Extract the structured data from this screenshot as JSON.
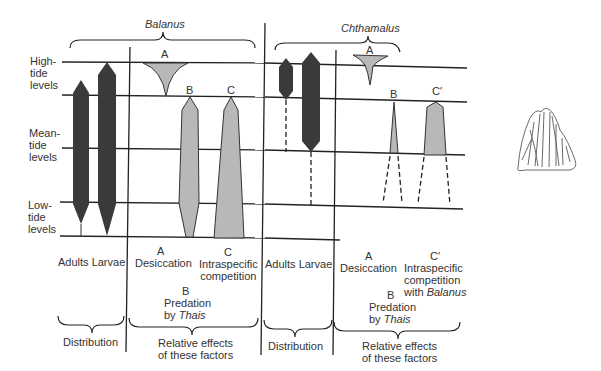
{
  "species": {
    "balanus": "Balanus",
    "chthamalus": "Chthamalus"
  },
  "tide_labels": {
    "high": [
      "High-",
      "tide",
      "levels"
    ],
    "mean": [
      "Mean-",
      "tide",
      "levels"
    ],
    "low": [
      "Low-",
      "tide",
      "levels"
    ]
  },
  "balanus_panel": {
    "distribution_cols": "Adults Larvae",
    "distribution_label": "Distribution",
    "factor_a_letter": "A",
    "factor_a": "Desiccation",
    "factor_b_letter": "B",
    "factor_b_line1": "Predation",
    "factor_b_by": "by ",
    "factor_b_genus": "Thais",
    "factor_c_letter": "C",
    "factor_c_line1": "Intraspecific",
    "factor_c_line2": "competition",
    "effects_line1": "Relative effects",
    "effects_line2": "of these factors"
  },
  "chthamalus_panel": {
    "distribution_cols": "Adults Larvae",
    "distribution_label": "Distribution",
    "factor_a_letter": "A",
    "factor_a": "Desiccation",
    "factor_b_letter": "B",
    "factor_b_line1": "Predation",
    "factor_b_by": "by ",
    "factor_b_genus": "Thais",
    "factor_c_letter": "C′",
    "factor_c_line1": "Intraspecific",
    "factor_c_line2": "competition",
    "factor_c_line3_prefix": "with ",
    "factor_c_line3_genus": "Balanus",
    "effects_line1": "Relative effects",
    "effects_line2": "of these factors"
  },
  "colors": {
    "dark_bar": "#3a3a3a",
    "light_bar": "#b8b8b8",
    "line": "#222222"
  },
  "illustration": "barnacle-drawing"
}
